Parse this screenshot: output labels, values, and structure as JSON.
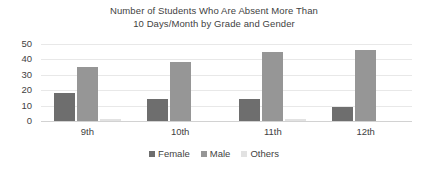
{
  "chart_data": {
    "type": "bar",
    "title": "Number of Students Who Are Absent More Than 10 Days/Month by Grade and Gender",
    "title_lines": [
      "Number of Students Who Are Absent More Than",
      "10 Days/Month by Grade and Gender"
    ],
    "xlabel": "",
    "ylabel": "",
    "categories": [
      "9th",
      "10th",
      "11th",
      "12th"
    ],
    "series": [
      {
        "name": "Female",
        "values": [
          18,
          14,
          14,
          9
        ],
        "color": "#6e6e6e"
      },
      {
        "name": "Male",
        "values": [
          35,
          38,
          45,
          46
        ],
        "color": "#969696"
      },
      {
        "name": "Others",
        "values": [
          1,
          0,
          1,
          0
        ],
        "color": "#e2e2e2"
      }
    ],
    "ylim": [
      0,
      50
    ],
    "yticks": [
      0,
      10,
      20,
      30,
      40,
      50
    ],
    "ytick_labels": [
      "0",
      "10",
      "20",
      "30",
      "40",
      "50"
    ],
    "grid": true,
    "grid_axis": "y",
    "legend_position": "bottom",
    "orientation": "vertical",
    "background": "#ffffff",
    "gridline_color": "#e8e8e8",
    "axis_color": "#d2d2d2",
    "text_color": "#3f3f3f"
  },
  "legend": {
    "items": [
      {
        "label": "Female",
        "color": "#6e6e6e"
      },
      {
        "label": "Male",
        "color": "#969696"
      },
      {
        "label": "Others",
        "color": "#e2e2e2"
      }
    ]
  }
}
